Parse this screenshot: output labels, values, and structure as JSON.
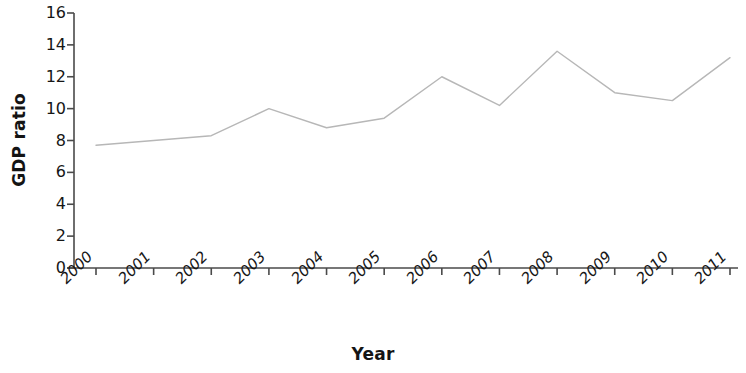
{
  "chart_data": {
    "type": "line",
    "title": "",
    "xlabel": "Year",
    "ylabel": "GDP ratio",
    "categories": [
      "2000",
      "2001",
      "2002",
      "2003",
      "2004",
      "2005",
      "2006",
      "2007",
      "2008",
      "2009",
      "2010",
      "2011"
    ],
    "values": [
      7.7,
      8.0,
      8.3,
      10.0,
      8.8,
      9.4,
      12.0,
      10.2,
      13.6,
      11.0,
      10.5,
      13.2
    ],
    "series": [
      {
        "name": "GDP ratio",
        "values": [
          7.7,
          8.0,
          8.3,
          10.0,
          8.8,
          9.4,
          12.0,
          10.2,
          13.6,
          11.0,
          10.5,
          13.2
        ]
      }
    ],
    "ylim": [
      0,
      16
    ],
    "yticks": [
      0,
      2,
      4,
      6,
      8,
      10,
      12,
      14,
      16
    ],
    "ytick_labels": [
      "0",
      "2",
      "4",
      "6",
      "8",
      "10",
      "12",
      "14",
      "16"
    ],
    "grid": false,
    "legend": false,
    "legend_position": "none",
    "line_color": "#b7b7b7",
    "axis_color": "#4a4a4a",
    "text_color": "#161616",
    "background_color": "#ffffff",
    "xtick_rotation_degrees": -45,
    "marker": "none"
  },
  "axes": {
    "y_title": "GDP ratio",
    "x_title": "Year"
  }
}
